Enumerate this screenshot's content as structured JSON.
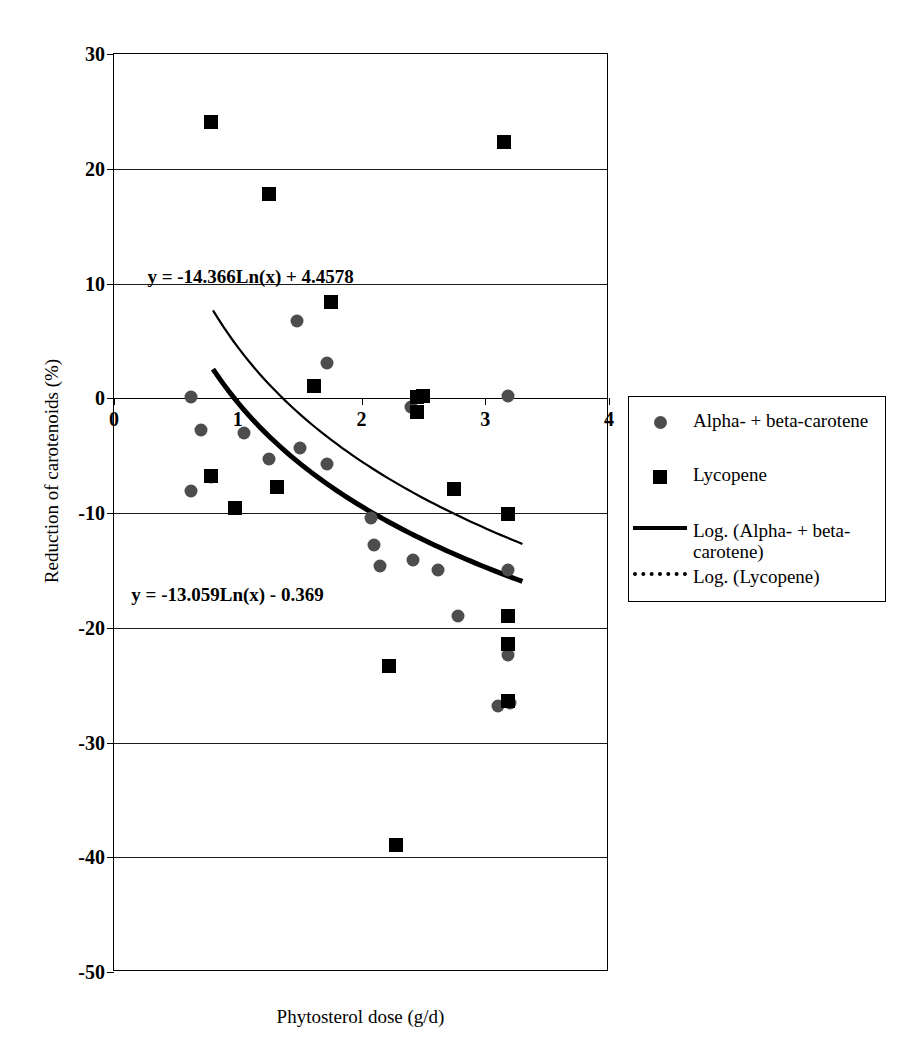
{
  "chart_data": {
    "type": "scatter",
    "title": "",
    "xlabel": "Phytosterol dose (g/d)",
    "ylabel": "Reduction of carotenoids (%)",
    "xlim": [
      0,
      4
    ],
    "ylim": [
      -50,
      30
    ],
    "xticks": [
      "0",
      "1",
      "2",
      "3",
      "4"
    ],
    "xtick_values": [
      0,
      1,
      2,
      3,
      4
    ],
    "yticks": [
      "30",
      "20",
      "10",
      "0",
      "-10",
      "-20",
      "-30",
      "-40",
      "-50"
    ],
    "ytick_values": [
      30,
      20,
      10,
      0,
      -10,
      -20,
      -30,
      -40,
      -50
    ],
    "grid": "horizontal",
    "legend_position": "right",
    "series": [
      {
        "name": "Alpha- + beta-carotene",
        "marker": "circle",
        "color": "#4d4d4d",
        "points": [
          {
            "x": 0.62,
            "y": 0.1
          },
          {
            "x": 0.62,
            "y": -8.1
          },
          {
            "x": 0.7,
            "y": -2.8
          },
          {
            "x": 0.78,
            "y": -6.9
          },
          {
            "x": 1.05,
            "y": -3.0
          },
          {
            "x": 1.25,
            "y": -5.3
          },
          {
            "x": 1.48,
            "y": 6.7
          },
          {
            "x": 1.5,
            "y": -4.3
          },
          {
            "x": 1.72,
            "y": 3.1
          },
          {
            "x": 1.72,
            "y": -5.7
          },
          {
            "x": 2.08,
            "y": -10.4
          },
          {
            "x": 2.1,
            "y": -12.8
          },
          {
            "x": 2.15,
            "y": -14.6
          },
          {
            "x": 2.4,
            "y": -0.8
          },
          {
            "x": 2.42,
            "y": -14.1
          },
          {
            "x": 2.62,
            "y": -15.0
          },
          {
            "x": 2.78,
            "y": -19.0
          },
          {
            "x": 3.18,
            "y": 0.2
          },
          {
            "x": 3.18,
            "y": -15.0
          },
          {
            "x": 3.18,
            "y": -22.4
          },
          {
            "x": 3.1,
            "y": -26.8
          },
          {
            "x": 3.2,
            "y": -26.6
          }
        ]
      },
      {
        "name": "Lycopene",
        "marker": "square",
        "color": "#000000",
        "points": [
          {
            "x": 0.78,
            "y": 24.1
          },
          {
            "x": 0.78,
            "y": -6.8
          },
          {
            "x": 0.98,
            "y": -9.6
          },
          {
            "x": 1.25,
            "y": 17.8
          },
          {
            "x": 1.32,
            "y": -7.7
          },
          {
            "x": 1.75,
            "y": 8.4
          },
          {
            "x": 1.62,
            "y": 1.1
          },
          {
            "x": 2.45,
            "y": 0.1
          },
          {
            "x": 2.45,
            "y": -1.2
          },
          {
            "x": 2.5,
            "y": 0.2
          },
          {
            "x": 2.75,
            "y": -7.9
          },
          {
            "x": 2.22,
            "y": -23.3
          },
          {
            "x": 2.28,
            "y": -38.9
          },
          {
            "x": 3.15,
            "y": 22.3
          },
          {
            "x": 3.18,
            "y": -10.1
          },
          {
            "x": 3.18,
            "y": -19.0
          },
          {
            "x": 3.18,
            "y": -21.4
          },
          {
            "x": 3.18,
            "y": -26.4
          }
        ]
      }
    ],
    "trendlines": [
      {
        "name": "Log. (Alpha- + beta-carotene)",
        "style": "solid-thick",
        "equation": "y = -13.059Ln(x) - 0.369",
        "coef_a": -13.059,
        "coef_b": -0.369,
        "x_start": 0.8,
        "x_end": 3.3
      },
      {
        "name": "Log. (Lycopene)",
        "style": "solid-thin",
        "equation": "y = -14.366Ln(x) + 4.4578",
        "coef_a": -14.366,
        "coef_b": 4.4578,
        "x_start": 0.8,
        "x_end": 3.3
      }
    ],
    "annotations": [
      {
        "id": "eq-lycopene",
        "text": "y = -14.366Ln(x) + 4.4578",
        "x": 0.27,
        "y": 11.5
      },
      {
        "id": "eq-carotene",
        "text": "y = -13.059Ln(x) - 0.369",
        "x": 0.14,
        "y": -16.2
      }
    ]
  },
  "legend": {
    "entries": [
      {
        "key": "circle",
        "label": "Alpha- + beta-carotene"
      },
      {
        "key": "square",
        "label": "Lycopene"
      },
      {
        "key": "solid-line",
        "label": "Log. (Alpha- + beta-carotene)"
      },
      {
        "key": "dotted-line",
        "label": "Log. (Lycopene)"
      }
    ]
  }
}
